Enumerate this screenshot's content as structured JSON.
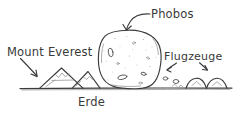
{
  "diagram": {
    "style": "hand-drawn pencil sketch, black ink on white",
    "colors": {
      "ink": "#3c3c3c",
      "ink_light": "#8a8a8a",
      "background": "#ffffff",
      "text": "#3a3a3a"
    },
    "labels": {
      "phobos": "Phobos",
      "mount_everest": "Mount Everest",
      "flugzeuge": "Flugzeuge",
      "erde": "Erde"
    },
    "annotations": [
      {
        "id": "phobos-annotation",
        "label": "Phobos",
        "target": "phobos-blob",
        "arrow": "curved-arrow-down-left"
      },
      {
        "id": "mount-everest-annotation",
        "label": "Mount Everest",
        "target": "mountain-large",
        "arrow": "arrow-down-right"
      },
      {
        "id": "flugzeuge-annotation",
        "label": "Flugzeuge",
        "target": "airplane-hills",
        "arrow": "two-short-arrows-down"
      },
      {
        "id": "erde-annotation",
        "label": "Erde",
        "target": "ground-line",
        "arrow": "none"
      }
    ],
    "objects": {
      "phobos": "irregular potato-shaped moon with craters",
      "mountains": "two triangular mountain peaks",
      "airplane_hills": "small rounded bumps at right",
      "ground": "horizontal ground line"
    }
  }
}
